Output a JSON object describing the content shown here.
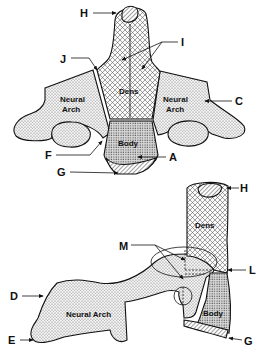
{
  "diagram": {
    "views": [
      {
        "name": "front-view",
        "parts": {
          "dens": "Dens",
          "body": "Body",
          "neural_arch_left": "Neural\nArch",
          "neural_arch_right": "Neural\nArch"
        },
        "labels": {
          "H": "H",
          "I": "I",
          "J": "J",
          "C": "C",
          "F": "F",
          "A": "A",
          "G": "G"
        }
      },
      {
        "name": "side-view",
        "parts": {
          "dens": "Dens",
          "body": "Body",
          "neural_arch": "Neural Arch"
        },
        "labels": {
          "H": "H",
          "M": "M",
          "L": "L",
          "D": "D",
          "E": "E",
          "G": "G"
        }
      }
    ],
    "colors": {
      "line": "#111111",
      "background": "#ffffff",
      "stipple": "#444444",
      "fill_light": "#e6e6e6"
    }
  }
}
